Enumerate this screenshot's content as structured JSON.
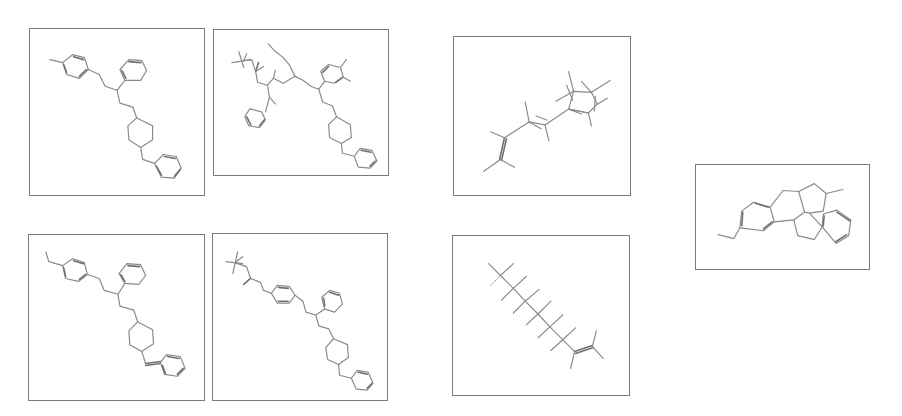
{
  "figure": {
    "stroke_color": "#8a8a8a",
    "border_color": "#7a7a7a",
    "background": "#ffffff"
  },
  "molecules": [
    {
      "id": "structure-1",
      "box": {
        "x": 29,
        "y": 28,
        "w": 176,
        "h": 168
      },
      "description": "methylphenyl-propyl chain, phenyl branch, cyclohexyl, benzyl"
    },
    {
      "id": "structure-2",
      "box": {
        "x": 213,
        "y": 29,
        "w": 176,
        "h": 147
      },
      "description": "tert-butyl ketone chain, benzyl, dimethylphenyl, cyclohexyl, benzyl"
    },
    {
      "id": "structure-3",
      "box": {
        "x": 453,
        "y": 36,
        "w": 178,
        "h": 160
      },
      "description": "branched alkene chain with substituted cyclohexane"
    },
    {
      "id": "structure-4",
      "box": {
        "x": 28,
        "y": 234,
        "w": 177,
        "h": 167
      },
      "description": "ethylphenyl-propyl chain, phenyl branch, cyclohexyl, benzylidene"
    },
    {
      "id": "structure-5",
      "box": {
        "x": 212,
        "y": 233,
        "w": 176,
        "h": 168
      },
      "description": "tert-butyl ketone, phenyl linker, phenyl branch, cyclohexyl, benzyl"
    },
    {
      "id": "structure-6",
      "box": {
        "x": 452,
        "y": 235,
        "w": 178,
        "h": 161
      },
      "description": "highly branched alkane chain ending in alkene"
    },
    {
      "id": "structure-7",
      "box": {
        "x": 695,
        "y": 164,
        "w": 175,
        "h": 106
      },
      "description": "fused polycyclic ring system with ethyl and methyl substituents"
    }
  ]
}
